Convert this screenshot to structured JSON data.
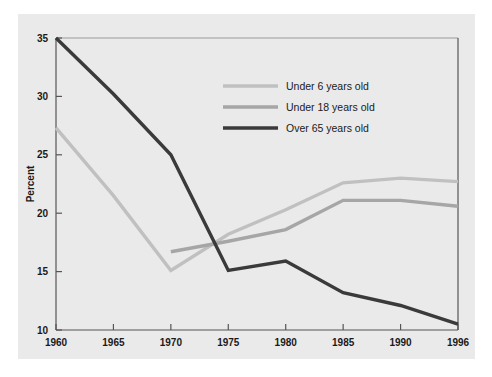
{
  "chart_data": {
    "type": "line",
    "title": "",
    "subtitle": "",
    "xlabel": "",
    "ylabel": "Percent",
    "x": [
      1960,
      1965,
      1970,
      1975,
      1980,
      1985,
      1990,
      1996
    ],
    "xticklabels": [
      "1960",
      "1965",
      "1970",
      "1975",
      "1980",
      "1985",
      "1990",
      "1996"
    ],
    "yticklabels": [
      "10",
      "15",
      "20",
      "25",
      "30",
      "35"
    ],
    "yticks": [
      10,
      15,
      20,
      25,
      30,
      35
    ],
    "xlim": [
      1960,
      1996
    ],
    "ylim": [
      10,
      35
    ],
    "grid": false,
    "legend_position": "upper-right-inside",
    "series": [
      {
        "name": "Under 6 years old",
        "color": "#c0c0c0",
        "x": [
          1960,
          1965,
          1970,
          1975,
          1980,
          1985,
          1990,
          1996
        ],
        "values": [
          27.3,
          21.5,
          15.1,
          18.2,
          20.3,
          22.6,
          23.0,
          22.7
        ]
      },
      {
        "name": "Under 18 years old",
        "color": "#a6a6a6",
        "x": [
          1970,
          1975,
          1980,
          1985,
          1990,
          1996
        ],
        "values": [
          16.7,
          17.6,
          18.6,
          21.1,
          21.1,
          20.6
        ]
      },
      {
        "name": "Over 65 years old",
        "color": "#3a3a3a",
        "x": [
          1960,
          1965,
          1970,
          1975,
          1980,
          1985,
          1990,
          1996
        ],
        "values": [
          35.0,
          30.2,
          25.0,
          15.1,
          15.9,
          13.2,
          12.1,
          10.5
        ]
      }
    ],
    "legend": [
      {
        "label": "Under 6 years old",
        "color": "#c0c0c0"
      },
      {
        "label": "Under 18 years old",
        "color": "#a6a6a6"
      },
      {
        "label": "Over 65 years old",
        "color": "#3a3a3a"
      }
    ],
    "colors": {
      "panel_background": "#eaeaea",
      "figure_background": "#ffffff",
      "axis_line": "#555555",
      "text": "#1a1a1a"
    }
  }
}
